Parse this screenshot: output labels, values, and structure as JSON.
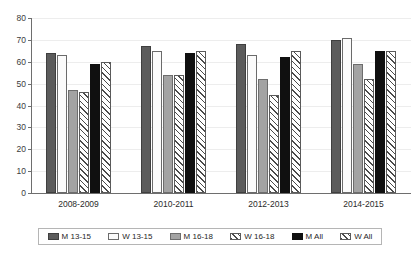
{
  "chart_data": {
    "type": "bar",
    "title": "",
    "xlabel": "",
    "ylabel": "",
    "ylim": [
      0,
      80
    ],
    "yticks": [
      0,
      10,
      20,
      30,
      40,
      50,
      60,
      70,
      80
    ],
    "grid": true,
    "legend_position": "bottom",
    "categories": [
      "2008-2009",
      "2010-2011",
      "2012-2013",
      "2014-2015"
    ],
    "series": [
      {
        "name": "M 13-15",
        "fill": "dark-gray-solid",
        "values": [
          64,
          67,
          68,
          70
        ]
      },
      {
        "name": "W 13-15",
        "fill": "white-outline",
        "values": [
          63,
          65,
          63,
          71
        ]
      },
      {
        "name": "M 16-18",
        "fill": "medium-gray-solid",
        "values": [
          47,
          54,
          52,
          59
        ]
      },
      {
        "name": "W 16-18",
        "fill": "white-diagonal-hatch",
        "values": [
          46,
          54,
          45,
          52
        ]
      },
      {
        "name": "M All",
        "fill": "black-solid",
        "values": [
          59,
          64,
          62,
          65
        ]
      },
      {
        "name": "W All",
        "fill": "white-diagonal-hatch",
        "values": [
          60,
          65,
          65,
          65
        ]
      }
    ]
  },
  "legend": {
    "items": [
      {
        "label": "M 13-15"
      },
      {
        "label": "W 13-15"
      },
      {
        "label": "M 16-18"
      },
      {
        "label": "W 16-18"
      },
      {
        "label": "M All"
      },
      {
        "label": "W All"
      }
    ]
  },
  "colors": {
    "series_m_13_15": "#5c5c5c",
    "series_w_13_15": "#fbfbfb",
    "series_m_16_18": "#a3a3a3",
    "series_w_16_18": "#ffffff",
    "series_m_all": "#101010",
    "series_w_all": "#ffffff",
    "gridline": "#ededed",
    "axis": "#6e6e6e",
    "text": "#1f1f1f"
  }
}
